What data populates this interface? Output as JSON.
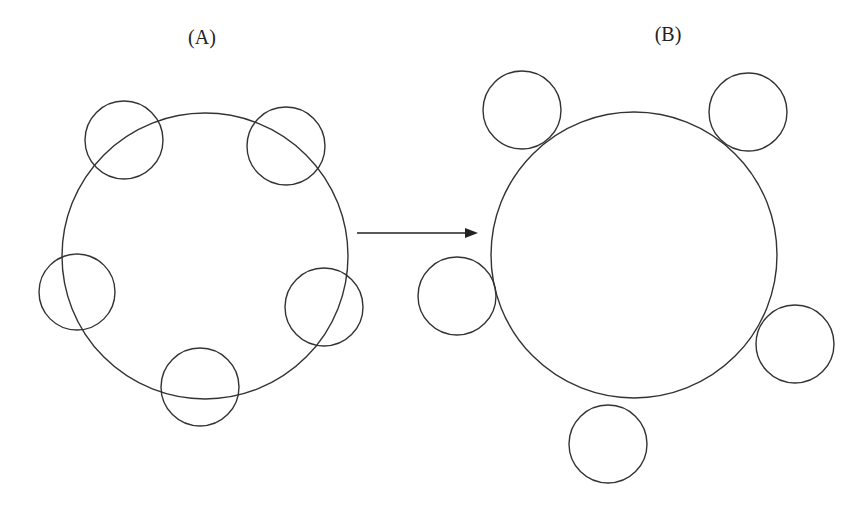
{
  "figure": {
    "panels": [
      {
        "id": "A",
        "label": "(A)",
        "label_pos": {
          "x": 202,
          "y": 26
        },
        "description": "Large circle overlapped by five small circles",
        "big_circle": {
          "cx": 205,
          "cy": 256,
          "r": 143
        },
        "small_circles": [
          {
            "cx": 124,
            "cy": 140,
            "r": 39
          },
          {
            "cx": 286,
            "cy": 146,
            "r": 39
          },
          {
            "cx": 77,
            "cy": 292,
            "r": 38
          },
          {
            "cx": 324,
            "cy": 307,
            "r": 39
          },
          {
            "cx": 200,
            "cy": 387,
            "r": 39
          }
        ]
      },
      {
        "id": "B",
        "label": "(B)",
        "label_pos": {
          "x": 668,
          "y": 23
        },
        "description": "Large circle with five small circles touching tangentially on the outside",
        "big_circle": {
          "cx": 634,
          "cy": 255,
          "r": 143
        },
        "small_circles": [
          {
            "cx": 522,
            "cy": 110,
            "r": 39
          },
          {
            "cx": 748,
            "cy": 112,
            "r": 39
          },
          {
            "cx": 457,
            "cy": 296,
            "r": 39
          },
          {
            "cx": 795,
            "cy": 344,
            "r": 39
          },
          {
            "cx": 608,
            "cy": 444,
            "r": 39
          }
        ]
      }
    ],
    "arrow": {
      "x1": 357,
      "y1": 233,
      "x2": 478,
      "y2": 233
    },
    "colors": {
      "background": "#ffffff",
      "stroke": "#333333",
      "text": "#222222"
    }
  }
}
